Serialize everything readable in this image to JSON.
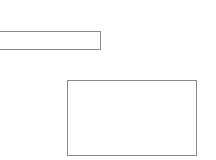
{
  "form": {
    "text_field": {
      "value": "",
      "placeholder": ""
    },
    "text_area": {
      "value": "",
      "placeholder": ""
    }
  },
  "colors": {
    "background": "#ffffff",
    "border": "#8a8a8a"
  }
}
